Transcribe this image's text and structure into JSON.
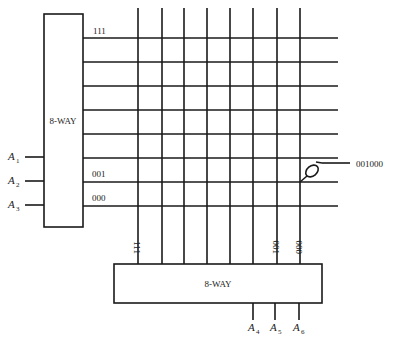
{
  "diagram": {
    "type": "two-dimensional decoder matrix",
    "left_decoder": {
      "label": "8-WAY",
      "inputs": [
        "A",
        "A",
        "A"
      ],
      "input_subs": [
        "1",
        "2",
        "3"
      ]
    },
    "bottom_decoder": {
      "label": "8-WAY",
      "inputs": [
        "A",
        "A",
        "A"
      ],
      "input_subs": [
        "4",
        "5",
        "6"
      ]
    },
    "row_labels": {
      "top": "111",
      "row_001": "001",
      "row_000": "000"
    },
    "column_labels": {
      "left": "111",
      "col_001": "001",
      "col_000": "000"
    },
    "selected_output": {
      "label": "001000"
    },
    "line_color": "#1a1a1a"
  }
}
